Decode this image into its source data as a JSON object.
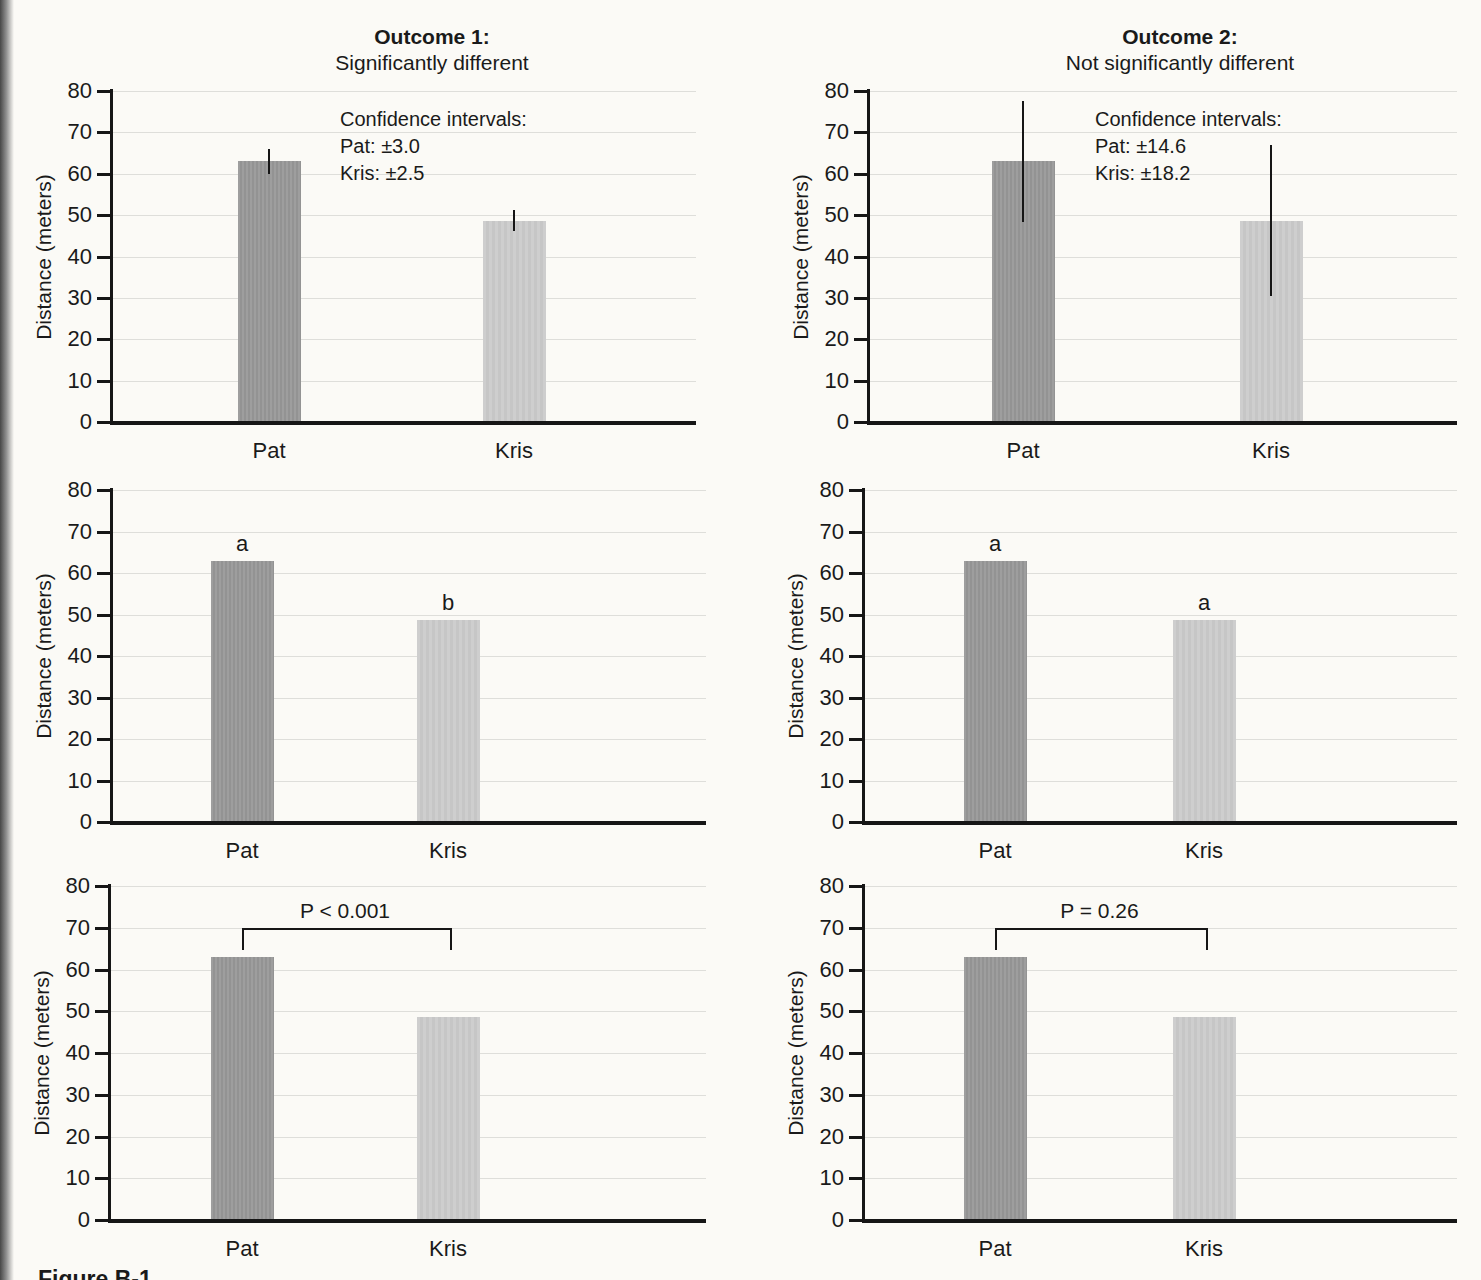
{
  "page": {
    "caption_fragment": "Figure B-1"
  },
  "colors": {
    "pat_bar": "#999999",
    "kris_bar": "#cccccc",
    "gridline": "#dededa",
    "axis": "#161616",
    "background": "#fbfaf6"
  },
  "chart_data": {
    "type": "bar",
    "categories": [
      "Pat",
      "Kris"
    ],
    "values": [
      63,
      48.7
    ],
    "ylabel": "Distance (meters)",
    "ylim": [
      0,
      80
    ],
    "ytick_step": 10,
    "yticks": [
      "0",
      "10",
      "20",
      "30",
      "40",
      "50",
      "60",
      "70",
      "80"
    ],
    "grid": "horizontal",
    "legend": "none",
    "panels": [
      {
        "position": "top-left",
        "title": "Outcome 1:",
        "subtitle": "Significantly different",
        "annotation": "error_bars",
        "ci_heading": "Confidence intervals:",
        "ci_lines": [
          "Pat: ±3.0",
          "Kris: ±2.5"
        ],
        "errors": [
          3.0,
          2.5
        ]
      },
      {
        "position": "top-right",
        "title": "Outcome 2:",
        "subtitle": "Not significantly different",
        "annotation": "error_bars",
        "ci_heading": "Confidence intervals:",
        "ci_lines": [
          "Pat: ±14.6",
          "Kris: ±18.2"
        ],
        "errors": [
          14.6,
          18.2
        ]
      },
      {
        "position": "middle-left",
        "annotation": "letters",
        "letters": [
          "a",
          "b"
        ]
      },
      {
        "position": "middle-right",
        "annotation": "letters",
        "letters": [
          "a",
          "a"
        ]
      },
      {
        "position": "bottom-left",
        "annotation": "pvalue",
        "p_label": "P < 0.001",
        "bracket_level": 70
      },
      {
        "position": "bottom-right",
        "annotation": "pvalue",
        "p_label": "P = 0.26",
        "bracket_level": 70
      }
    ]
  }
}
